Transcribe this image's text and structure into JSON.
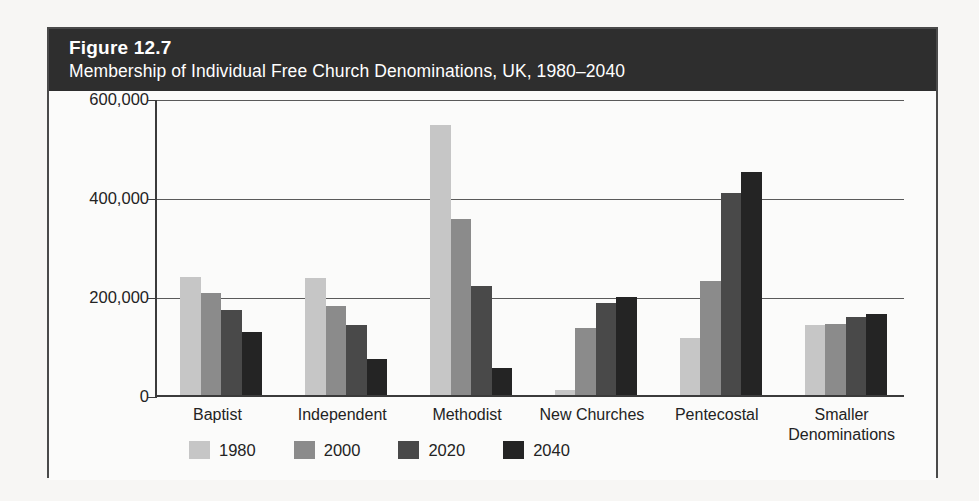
{
  "figure": {
    "number": "Figure 12.7",
    "caption": "Membership of Individual Free Church Denominations, UK, 1980–2040"
  },
  "colors": {
    "band_background": "#2e2e2e",
    "band_text": "#ffffff",
    "frame": "#4a4a4a",
    "axis": "#3b3b3b",
    "gridline": "#5a5a5a",
    "series_1980": "#c6c6c6",
    "series_2000": "#8b8b8b",
    "series_2020": "#494949",
    "series_2040": "#242424"
  },
  "chart_data": {
    "type": "bar",
    "title": "Membership of Individual Free Church Denominations, UK, 1980–2040",
    "xlabel": "",
    "ylabel": "",
    "grid": true,
    "legend_position": "bottom-left",
    "ylim": [
      0,
      600000
    ],
    "yticks": [
      0,
      200000,
      400000,
      600000
    ],
    "ytick_labels": [
      "0",
      "200,000",
      "400,000",
      "600,000"
    ],
    "categories": [
      "Baptist",
      "Independent",
      "Methodist",
      "New Churches",
      "Pentecostal",
      "Smaller Denominations"
    ],
    "category_labels": [
      [
        "Baptist"
      ],
      [
        "Independent"
      ],
      [
        "Methodist"
      ],
      [
        "New Churches"
      ],
      [
        "Pentecostal"
      ],
      [
        "Smaller",
        "Denominations"
      ]
    ],
    "series": [
      {
        "name": "1980",
        "color": "#c6c6c6",
        "values": [
          238000,
          237000,
          545000,
          10000,
          116000,
          142000
        ]
      },
      {
        "name": "2000",
        "color": "#8b8b8b",
        "values": [
          207000,
          180000,
          355000,
          135000,
          230000,
          143000
        ]
      },
      {
        "name": "2020",
        "color": "#494949",
        "values": [
          171000,
          141000,
          221000,
          186000,
          408000,
          158000
        ]
      },
      {
        "name": "2040",
        "color": "#242424",
        "values": [
          128000,
          73000,
          55000,
          198000,
          450000,
          163000
        ]
      }
    ]
  }
}
